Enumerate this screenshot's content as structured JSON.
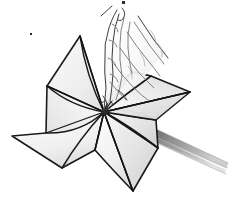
{
  "image": {
    "title": "Paper pinwheel line drawing",
    "subject": "pinwheel",
    "style": "pencil line drawing, grayscale",
    "background_color": "#ffffff",
    "outline_color": "#1a1a1a",
    "blade_fill_light": "#fdfdfd",
    "blade_fill_mid": "#e6e6e6",
    "blade_fill_shadow": "#cfcfcf",
    "stick_color": "#6f6f6f",
    "sketch_color": "#6b6b6b",
    "width": 239,
    "height": 200
  },
  "scene": {
    "center_hub": {
      "x": 104,
      "y": 112,
      "label": "pinwheel-center-pin"
    },
    "blades": [
      {
        "id": "blade-upper-left",
        "label": "Upper left blade",
        "tip": {
          "x": 80,
          "y": 36
        },
        "fill": "#f2f2f2"
      },
      {
        "id": "blade-left",
        "label": "Left blade",
        "tip": {
          "x": 12,
          "y": 136
        },
        "fill": "#ededed"
      },
      {
        "id": "blade-lower",
        "label": "Lower blade",
        "tip": {
          "x": 133,
          "y": 191
        },
        "fill": "#f4f4f4"
      },
      {
        "id": "blade-right",
        "label": "Right blade",
        "tip": {
          "x": 190,
          "y": 92
        },
        "fill": "#ebebeb"
      },
      {
        "id": "blade-lower-right",
        "label": "Lower right blade",
        "tip": {
          "x": 158,
          "y": 148
        },
        "fill": "#e2e2e2"
      }
    ],
    "stick": {
      "label": "Pinwheel stick",
      "start": {
        "x": 140,
        "y": 126
      },
      "end": {
        "x": 228,
        "y": 168
      },
      "color": "#6f6f6f"
    },
    "hand": {
      "label": "Sketched hand and fingers touching the pinwheel center",
      "region": {
        "x": 100,
        "y": 8,
        "width": 80,
        "height": 105
      }
    },
    "stray_marks": [
      {
        "id": "stray-dot-top",
        "x": 123,
        "y": 2,
        "size": 3
      },
      {
        "id": "stray-dot-left",
        "x": 31,
        "y": 34,
        "size": 2
      }
    ]
  }
}
